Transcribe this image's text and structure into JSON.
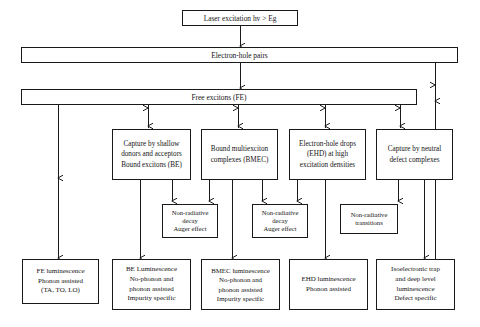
{
  "diagram": {
    "line_color": "#1a1a1a",
    "background": "#ffffff"
  },
  "nodes": {
    "laser": {
      "lines": [
        "Laser excitation hv > Eg"
      ]
    },
    "ehp": {
      "lines": [
        "Electron-hole pairs"
      ]
    },
    "fe": {
      "lines": [
        "Free excitons (FE)"
      ]
    },
    "capture_shallow": {
      "lines": [
        "Capture by shallow",
        "donors and acceptors",
        "Bound excitons (BE)"
      ]
    },
    "bmec": {
      "lines": [
        "Bound multiexciton",
        "complexes (BMEC)"
      ]
    },
    "ehd": {
      "lines": [
        "Electron-hole drops",
        "(EHD) at high",
        "excitation densities"
      ]
    },
    "capture_neutral": {
      "lines": [
        "Capture by neutral",
        "defect complexes"
      ]
    },
    "nonrad_be": {
      "lines": [
        "Non-radiative",
        "decay",
        "Auger effect"
      ]
    },
    "nonrad_bmec": {
      "lines": [
        "Non-radiative",
        "decay",
        "Auger effect"
      ]
    },
    "nonrad_trans": {
      "lines": [
        "Non-radiative",
        "transitions"
      ]
    },
    "fe_lum": {
      "lines": [
        "FE luminescence",
        "Phonon assisted",
        "(TA, TO, LO)"
      ]
    },
    "be_lum": {
      "lines": [
        "BE Luminescence",
        "No-phonon and",
        "phonon assisted",
        "Impurity specific"
      ]
    },
    "bmec_lum": {
      "lines": [
        "BMEC luminescence",
        "No-phonon and",
        "phonon assisted",
        "Impurity specific"
      ]
    },
    "ehd_lum": {
      "lines": [
        "EHD luminescence",
        "Phonon assisted"
      ]
    },
    "iso_lum": {
      "lines": [
        "Isoelectronic trap",
        "and deep level",
        "luminescence",
        "Defect specific"
      ]
    }
  }
}
